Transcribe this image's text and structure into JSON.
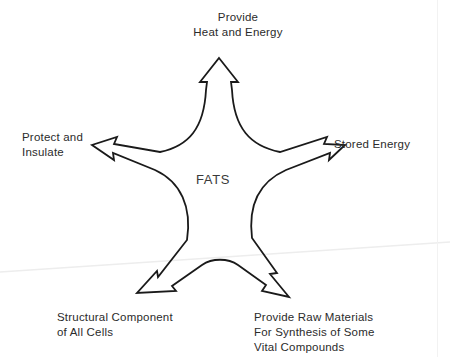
{
  "diagram": {
    "center_label": "FATS",
    "type": "five-point star arrow diagram",
    "stroke_color": "#1a1a1a",
    "text_color": "#2b2b2b",
    "background_color": "#ffffff",
    "nodes": [
      {
        "id": "top",
        "label": "Provide\nHeat and Energy",
        "direction": "up",
        "arrow_tip": [
          219,
          58
        ]
      },
      {
        "id": "left",
        "label": "Protect and\nInsulate",
        "direction": "up-left",
        "arrow_tip": [
          92,
          145
        ]
      },
      {
        "id": "right",
        "label": "Stored Energy",
        "direction": "up-right",
        "arrow_tip": [
          345,
          145
        ]
      },
      {
        "id": "bottom-left",
        "label": "Structural Component\nof All Cells",
        "direction": "down-left",
        "arrow_tip": [
          137,
          293
        ]
      },
      {
        "id": "bottom-right",
        "label": "Provide Raw Materials\nFor Synthesis of Some\nVital Compounds",
        "direction": "down-right",
        "arrow_tip": [
          289,
          297
        ]
      }
    ],
    "artifacts": {
      "scan_line_color": "#ededed",
      "page_edge_color": "#f2f2f2"
    }
  }
}
